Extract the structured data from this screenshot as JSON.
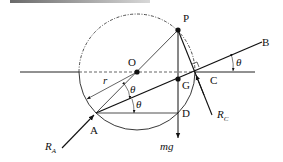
{
  "diagram": {
    "type": "mechanics free-body diagram",
    "points": {
      "P": "P",
      "O": "O",
      "G": "G",
      "C": "C",
      "B": "B",
      "A": "A",
      "D": "D"
    },
    "labels": {
      "radius": "r",
      "angle": "θ",
      "weight": "mg",
      "reaction_A_main": "R",
      "reaction_A_sub": "A",
      "reaction_C_main": "R",
      "reaction_C_sub": "C"
    },
    "colors": {
      "line": "#111111",
      "background": "#ffffff"
    }
  }
}
